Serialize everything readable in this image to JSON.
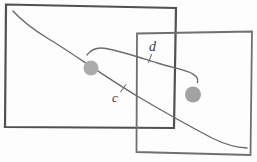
{
  "figure": {
    "background": "#fdfdfd",
    "canvas": {
      "width": 257,
      "height": 162
    },
    "rectangles": {
      "left": {
        "points": "6,4.5 176,8 174,128 5,127",
        "stroke": "#515151",
        "stroke_width": 2.2
      },
      "right": {
        "points": "137,33.5 252,31.5 250.5,155 136.5,152",
        "stroke": "#707070",
        "stroke_width": 1.8
      }
    },
    "curves": {
      "c": {
        "path": "M 13 11 C 22 21, 34 30, 48 38.5 C 70 51.5, 102 75, 137 96 C 164 112, 191 127, 212 138 C 224 144, 237 147.5, 247 148",
        "stroke": "#6b6b6b",
        "stroke_width": 1.4
      },
      "d": {
        "path": "M 87 55 C 91 49.5, 98 47, 106 48.5 C 122 51.5, 141 58, 159 63.5 C 172 67.5, 186 70, 192 73.5 C 196 76, 198.5 77.5, 197.5 82.5",
        "stroke": "#6b6b6b",
        "stroke_width": 1.4
      }
    },
    "dots": {
      "left": {
        "cx": 91,
        "cy": 68,
        "r": 7.5,
        "fill": "#ababab"
      },
      "right": {
        "cx": 193,
        "cy": 94.5,
        "r": 8,
        "fill": "#a2a2a2"
      }
    },
    "leaders": {
      "d": {
        "x1": 151.5,
        "y1": 54.5,
        "x2": 148.5,
        "y2": 62.5,
        "stroke": "#5e5e5e",
        "stroke_width": 1
      },
      "c": {
        "x1": 120.5,
        "y1": 92,
        "x2": 126,
        "y2": 84.5,
        "stroke": "#5e5e5e",
        "stroke_width": 1
      }
    },
    "labels": {
      "d": {
        "text": "d",
        "x": 149,
        "y": 51,
        "font_size": 14
      },
      "c": {
        "text": "c",
        "x": 112,
        "y": 102,
        "font_size": 13
      }
    }
  }
}
